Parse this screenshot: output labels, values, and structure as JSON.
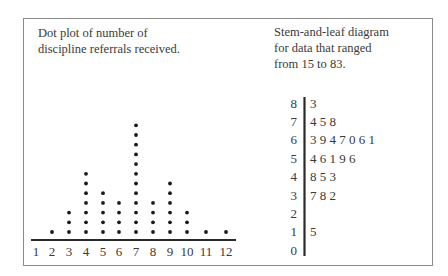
{
  "dot_plot": {
    "caption": "Dot plot of number of discipline referrals received.",
    "caption_lines": [
      "Dot plot of number of",
      "discipline referrals received."
    ],
    "axis_labels": [
      "1",
      "2",
      "3",
      "4",
      "5",
      "6",
      "7",
      "8",
      "9",
      "10",
      "11",
      "12"
    ]
  },
  "stem_leaf": {
    "caption": "Stem-and-leaf diagram for data that ranged from 15 to 83.",
    "caption_lines": [
      "Stem-and-leaf diagram",
      "for data that ranged",
      "from 15 to 83."
    ],
    "rows": [
      {
        "stem": "8",
        "leaves": "3"
      },
      {
        "stem": "7",
        "leaves": "4 5 8"
      },
      {
        "stem": "6",
        "leaves": "3 9 4 7 0 6 1"
      },
      {
        "stem": "5",
        "leaves": "4 6 1 9 6"
      },
      {
        "stem": "4",
        "leaves": "8 5 3"
      },
      {
        "stem": "3",
        "leaves": "7 8 2"
      },
      {
        "stem": "2",
        "leaves": ""
      },
      {
        "stem": "1",
        "leaves": "5"
      },
      {
        "stem": "0",
        "leaves": ""
      }
    ]
  },
  "chart_data": [
    {
      "type": "dot",
      "title": "Dot plot of number of discipline referrals received.",
      "xlabel": "",
      "ylabel": "",
      "categories": [
        1,
        2,
        3,
        4,
        5,
        6,
        7,
        8,
        9,
        10,
        11,
        12
      ],
      "values": [
        0,
        1,
        3,
        7,
        5,
        4,
        12,
        4,
        6,
        3,
        1,
        1
      ],
      "grid": false
    },
    {
      "type": "table",
      "title": "Stem-and-leaf diagram for data that ranged from 15 to 83.",
      "stems": [
        8,
        7,
        6,
        5,
        4,
        3,
        2,
        1,
        0
      ],
      "leaves": [
        [
          3
        ],
        [
          4,
          5,
          8
        ],
        [
          3,
          9,
          4,
          7,
          0,
          6,
          1
        ],
        [
          4,
          6,
          1,
          9,
          6
        ],
        [
          8,
          5,
          3
        ],
        [
          7,
          8,
          2
        ],
        [],
        [
          5
        ],
        []
      ]
    }
  ]
}
